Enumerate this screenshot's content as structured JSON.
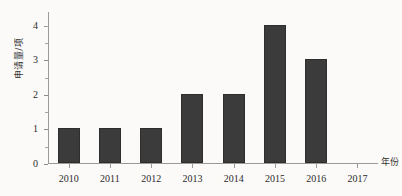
{
  "chart_data": {
    "type": "bar",
    "title": "",
    "subtitle": "",
    "xlabel": "年份",
    "ylabel": "申请量/项",
    "categories": [
      "2010",
      "2011",
      "2012",
      "2013",
      "2014",
      "2015",
      "2016",
      "2017"
    ],
    "values": [
      1,
      1,
      1,
      2,
      2,
      4,
      3,
      0
    ],
    "series": [
      {
        "name": "申请量",
        "values": [
          1,
          1,
          1,
          2,
          2,
          4,
          3,
          0
        ]
      }
    ],
    "ylim": [
      0,
      4.4
    ],
    "xlim_note": "categorical",
    "ytick_labels": [
      "0",
      "1",
      "2",
      "3",
      "4"
    ],
    "ytick_values": [
      0,
      1,
      2,
      3,
      4
    ],
    "yminor_tick_values": [
      0.5,
      1.5,
      2.5,
      3.5,
      4.0
    ],
    "grid": false,
    "legend": false,
    "legend_position": "none",
    "bar_color": "#3b3b3b",
    "axis_color": "#9a9a9a",
    "background_color": "#fbfaf8",
    "text_color": "#2b2b2b"
  }
}
